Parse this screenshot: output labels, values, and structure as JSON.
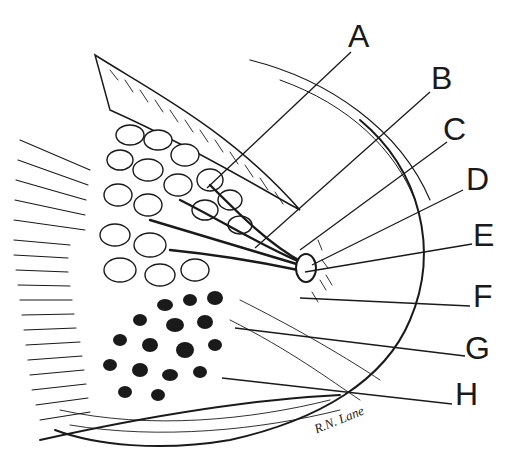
{
  "diagram": {
    "labels": [
      {
        "id": "A",
        "text": "A",
        "x": 348,
        "y": 20,
        "line_from": [
          351,
          52
        ],
        "line_to": [
          207,
          188
        ]
      },
      {
        "id": "B",
        "text": "B",
        "x": 431,
        "y": 62,
        "line_from": [
          430,
          92
        ],
        "line_to": [
          255,
          248
        ]
      },
      {
        "id": "C",
        "text": "C",
        "x": 443,
        "y": 113,
        "line_from": [
          447,
          142
        ],
        "line_to": [
          300,
          250
        ]
      },
      {
        "id": "D",
        "text": "D",
        "x": 466,
        "y": 163,
        "line_from": [
          463,
          190
        ],
        "line_to": [
          312,
          265
        ]
      },
      {
        "id": "E",
        "text": "E",
        "x": 473,
        "y": 219,
        "line_from": [
          472,
          244
        ],
        "line_to": [
          305,
          272
        ]
      },
      {
        "id": "F",
        "text": "F",
        "x": 473,
        "y": 280,
        "line_from": [
          470,
          306
        ],
        "line_to": [
          300,
          298
        ]
      },
      {
        "id": "G",
        "text": "G",
        "x": 465,
        "y": 332,
        "line_from": [
          465,
          356
        ],
        "line_to": [
          235,
          328
        ]
      },
      {
        "id": "H",
        "text": "H",
        "x": 455,
        "y": 378,
        "line_from": [
          452,
          404
        ],
        "line_to": [
          222,
          378
        ]
      }
    ],
    "signature": "R.N. Lane",
    "colors": {
      "ink": "#1a1a1a",
      "background": "#ffffff"
    }
  }
}
